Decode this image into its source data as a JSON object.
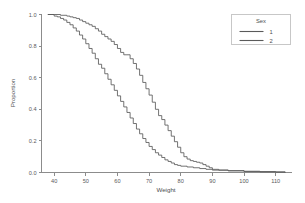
{
  "chart_data": {
    "type": "line",
    "title": "",
    "subtitle": "",
    "xlabel": "Weight",
    "ylabel": "Proportion",
    "xlim": [
      36,
      115
    ],
    "ylim": [
      0.0,
      1.0
    ],
    "xticks": [
      40,
      50,
      60,
      70,
      80,
      90,
      100,
      110
    ],
    "yticks": [
      0.0,
      0.2,
      0.4,
      0.6,
      0.8,
      1.0
    ],
    "xtick_labels": [
      "40",
      "50",
      "60",
      "70",
      "80",
      "90",
      "100",
      "110"
    ],
    "ytick_labels": [
      "0.0",
      "0.2",
      "0.4",
      "0.6",
      "0.8",
      "1.0"
    ],
    "grid": false,
    "legend": {
      "title": "Sex",
      "position": "top-right",
      "entries": [
        {
          "label": "1",
          "color": "#5a5a5a"
        },
        {
          "label": "2",
          "color": "#5a5a5a"
        }
      ]
    },
    "series": [
      {
        "name": "1",
        "label": "1",
        "color": "#5a5a5a",
        "description": "Reverse cumulative proportion, shifted right (higher weights)",
        "x": [
          38,
          40,
          42,
          44,
          45,
          46,
          47,
          48,
          49,
          50,
          51,
          52,
          53,
          54,
          55,
          56,
          57,
          58,
          59,
          60,
          61,
          62,
          63,
          64,
          65,
          66,
          67,
          68,
          69,
          70,
          71,
          72,
          73,
          74,
          75,
          76,
          77,
          78,
          79,
          80,
          81,
          82,
          83,
          84,
          85,
          86,
          87,
          88,
          89,
          90,
          92,
          95,
          100,
          105,
          110,
          113
        ],
        "y": [
          1.0,
          1.0,
          0.995,
          0.99,
          0.985,
          0.98,
          0.975,
          0.965,
          0.955,
          0.945,
          0.935,
          0.925,
          0.91,
          0.895,
          0.875,
          0.86,
          0.845,
          0.83,
          0.81,
          0.785,
          0.76,
          0.745,
          0.745,
          0.72,
          0.69,
          0.655,
          0.615,
          0.57,
          0.53,
          0.49,
          0.445,
          0.4,
          0.36,
          0.335,
          0.3,
          0.265,
          0.23,
          0.195,
          0.16,
          0.125,
          0.1,
          0.085,
          0.075,
          0.07,
          0.065,
          0.06,
          0.05,
          0.04,
          0.03,
          0.02,
          0.015,
          0.012,
          0.008,
          0.006,
          0.004,
          0.0
        ]
      },
      {
        "name": "2",
        "label": "2",
        "color": "#5a5a5a",
        "description": "Reverse cumulative proportion, shifted left (lower weights)",
        "x": [
          38,
          40,
          41,
          42,
          43,
          44,
          45,
          46,
          47,
          48,
          49,
          50,
          51,
          52,
          53,
          54,
          55,
          56,
          57,
          58,
          59,
          60,
          61,
          62,
          63,
          64,
          65,
          66,
          67,
          68,
          69,
          70,
          71,
          72,
          73,
          74,
          75,
          76,
          77,
          78,
          79,
          80,
          82,
          84,
          86,
          88,
          90,
          95,
          100,
          105,
          110,
          113
        ],
        "y": [
          1.0,
          0.99,
          0.985,
          0.975,
          0.965,
          0.95,
          0.935,
          0.915,
          0.895,
          0.87,
          0.845,
          0.815,
          0.785,
          0.755,
          0.72,
          0.685,
          0.66,
          0.625,
          0.59,
          0.555,
          0.52,
          0.485,
          0.45,
          0.415,
          0.38,
          0.345,
          0.31,
          0.275,
          0.245,
          0.215,
          0.19,
          0.165,
          0.145,
          0.125,
          0.11,
          0.095,
          0.08,
          0.07,
          0.06,
          0.05,
          0.045,
          0.04,
          0.035,
          0.03,
          0.025,
          0.02,
          0.015,
          0.01,
          0.006,
          0.004,
          0.002,
          0.0
        ]
      }
    ]
  },
  "colors": {
    "background": "#ffffff",
    "axis": "#8c8c8c",
    "text": "#4d4d4f",
    "series": "#5a5a5a",
    "legend_border": "#b9b9b9"
  }
}
